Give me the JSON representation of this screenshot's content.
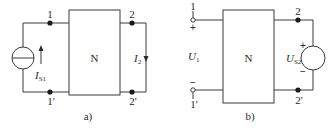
{
  "diagrams": [
    {
      "id": "a",
      "caption": "a)",
      "network_label": "N",
      "port1": {
        "top": "1",
        "bottom": "1'"
      },
      "port2": {
        "top": "2",
        "bottom": "2'"
      },
      "source": {
        "type": "current-source",
        "symbol": "I",
        "subscript": "S1",
        "direction": "up"
      },
      "measured": {
        "symbol": "I",
        "subscript": "2",
        "direction": "down",
        "connection": "short-circuit"
      }
    },
    {
      "id": "b",
      "caption": "b)",
      "network_label": "N",
      "port1": {
        "top": "1",
        "bottom": "1'",
        "top_sign": "+",
        "bottom_sign": "−",
        "connection": "open-circuit"
      },
      "port2": {
        "top": "2",
        "bottom": "2'"
      },
      "measured": {
        "symbol": "U",
        "subscript": "1"
      },
      "source": {
        "type": "voltage-source",
        "symbol": "U",
        "subscript": "S2",
        "plus": "+",
        "minus": "−"
      }
    }
  ],
  "colors": {
    "line": "#3a3a3a",
    "node": "#1a1a1a",
    "text": "#2a2a2a",
    "background": "#ffffff"
  }
}
